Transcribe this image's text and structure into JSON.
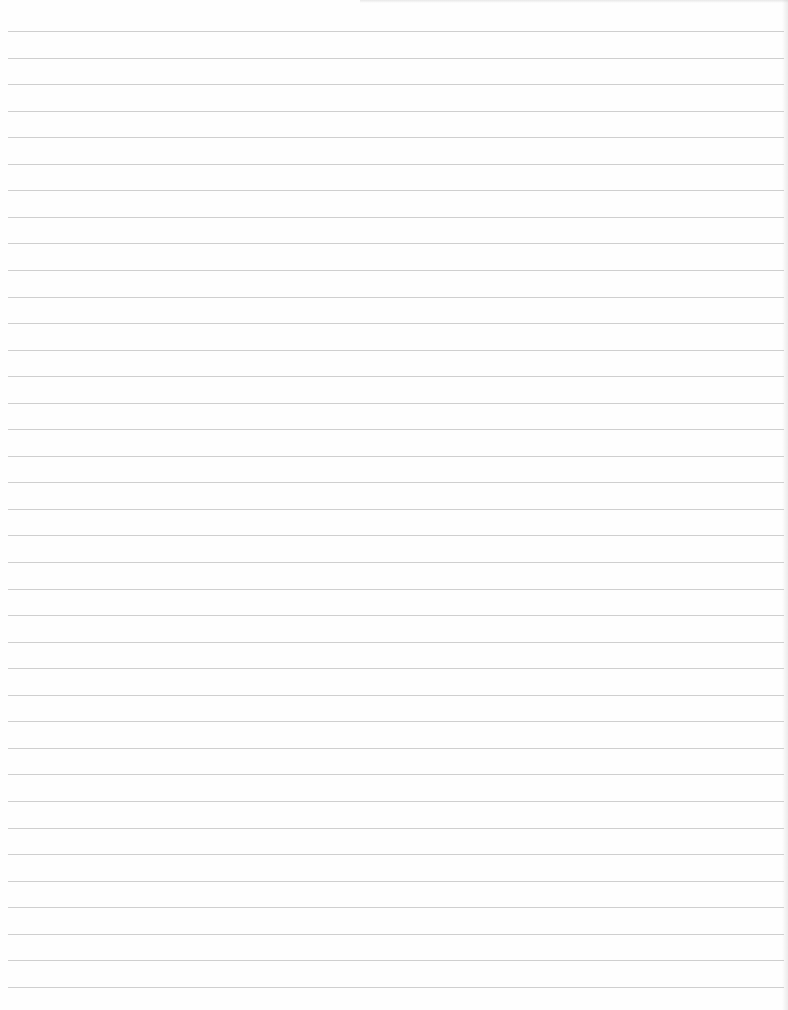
{
  "page": {
    "type": "lined-paper",
    "content_text": "",
    "line_color": "#cfcfcf",
    "background_color": "#fefefe",
    "rules": {
      "count": 37,
      "first_y": 31,
      "spacing": 26.55,
      "left_x": 8,
      "right_inset": 4
    }
  }
}
